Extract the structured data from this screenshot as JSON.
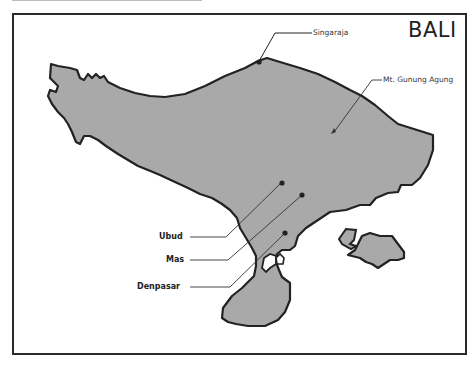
{
  "map": {
    "title": "BALI",
    "colors": {
      "land": "#a9a9a9",
      "coast": "#222222",
      "frame": "#2a2a2a",
      "background": "#ffffff"
    },
    "places": [
      {
        "name": "Singaraja",
        "type": "city",
        "marker": "dot"
      },
      {
        "name": "Mt. Gunung Agung",
        "type": "volcano",
        "marker": "triangle"
      },
      {
        "name": "Ubud",
        "type": "town",
        "marker": "dot"
      },
      {
        "name": "Mas",
        "type": "village",
        "marker": "dot"
      },
      {
        "name": "Denpasar",
        "type": "city",
        "marker": "dot"
      }
    ]
  }
}
